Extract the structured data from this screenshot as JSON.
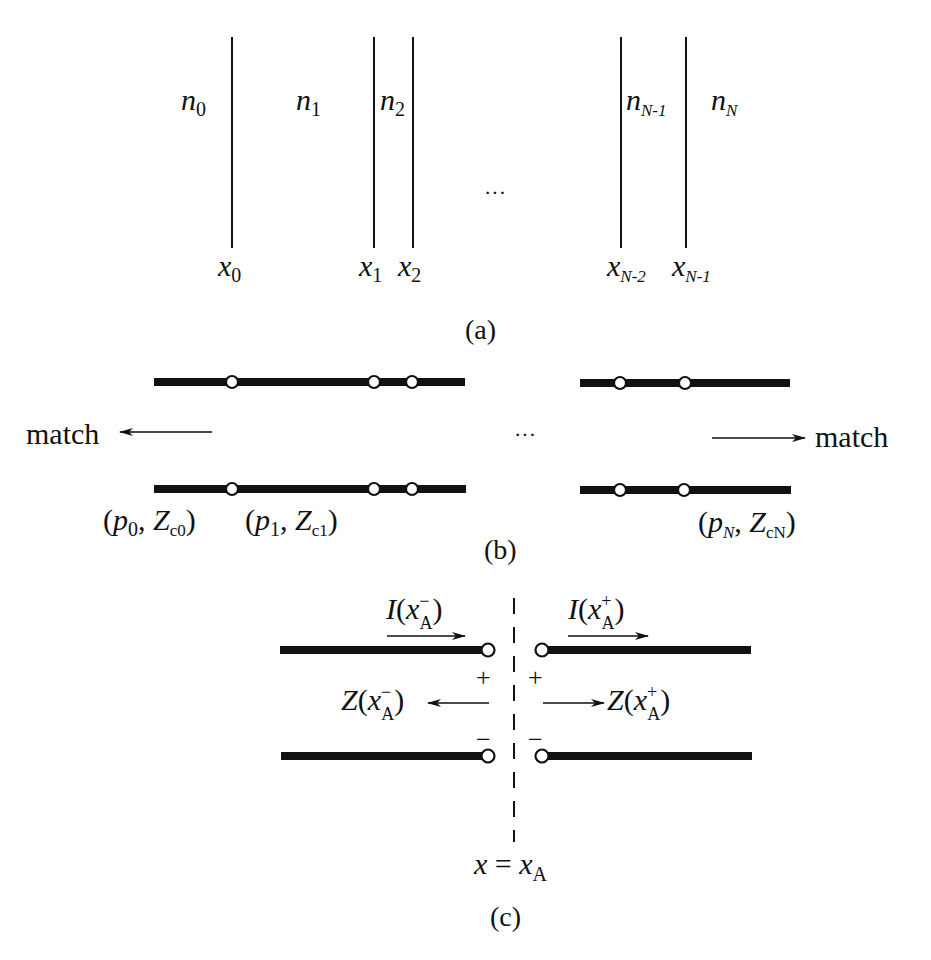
{
  "panel_a": {
    "caption": "(a)",
    "ellipsis": "···",
    "media": [
      {
        "base": "n",
        "sub": "0"
      },
      {
        "base": "n",
        "sub": "1"
      },
      {
        "base": "n",
        "sub": "2"
      },
      {
        "base": "n",
        "sub": "N-1"
      },
      {
        "base": "n",
        "sub": "N"
      }
    ],
    "interfaces": [
      {
        "base": "x",
        "sub": "0"
      },
      {
        "base": "x",
        "sub": "1"
      },
      {
        "base": "x",
        "sub": "2"
      },
      {
        "base": "x",
        "sub": "N-2"
      },
      {
        "base": "x",
        "sub": "N-1"
      }
    ]
  },
  "panel_b": {
    "caption": "(b)",
    "ellipsis": "···",
    "match_left": "match",
    "match_right": "match",
    "params": [
      {
        "open": "(",
        "p": "p",
        "p_sub": "0",
        "comma": ", ",
        "z": "Z",
        "z_sub": "c0",
        "close": ")"
      },
      {
        "open": "(",
        "p": "p",
        "p_sub": "1",
        "comma": ", ",
        "z": "Z",
        "z_sub": "c1",
        "close": ")"
      },
      {
        "open": "(",
        "p": "p",
        "p_sub": "N",
        "comma": ", ",
        "z": "Z",
        "z_sub": "cN",
        "close": ")"
      }
    ]
  },
  "panel_c": {
    "caption": "(c)",
    "current_left": {
      "I": "I",
      "x": "x",
      "sub": "A",
      "sup": "−"
    },
    "current_right": {
      "I": "I",
      "x": "x",
      "sub": "A",
      "sup": "+"
    },
    "impedance_left": {
      "Z": "Z",
      "x": "x",
      "sub": "A",
      "sup": "−"
    },
    "impedance_right": {
      "Z": "Z",
      "x": "x",
      "sub": "A",
      "sup": "+"
    },
    "plus": "+",
    "minus": "−",
    "plane_label": {
      "x": "x",
      "eq": " = ",
      "x2": "x",
      "sub": "A"
    },
    "paren_open": "(",
    "paren_close": ")"
  }
}
